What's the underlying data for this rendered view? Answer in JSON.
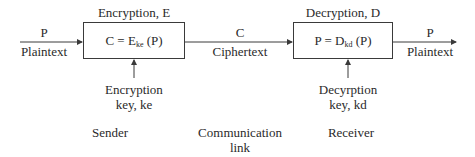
{
  "diagram": {
    "input": {
      "symbol": "P",
      "label": "Plaintext"
    },
    "encryption": {
      "title": "Encryption, E",
      "formula": {
        "lhs": "C = E",
        "sub": "ke",
        "rhs": " (P)"
      },
      "key_label_line1": "Encryption",
      "key_label_line2": "key, ke"
    },
    "channel": {
      "symbol": "C",
      "label": "Ciphertext"
    },
    "decryption": {
      "title": "Decryption, D",
      "formula": {
        "lhs": "P = D",
        "sub": "kd",
        "rhs": " (P)"
      },
      "key_label_line1": "Decyrption",
      "key_label_line2": "key, kd"
    },
    "output": {
      "symbol": "P",
      "label": "Plaintext"
    },
    "roles": {
      "sender": "Sender",
      "link_line1": "Communication",
      "link_line2": "link",
      "receiver": "Receiver"
    },
    "colors": {
      "line": "#3a3a3a",
      "text": "#2a2a2a",
      "background": "#ffffff"
    }
  }
}
